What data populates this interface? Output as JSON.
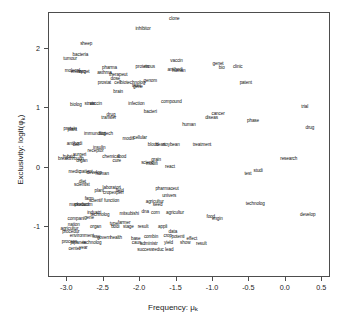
{
  "chart_data": {
    "type": "scatter",
    "title": "",
    "xlabel": "Frequency: μₖ",
    "ylabel": "Exclusivity: logit(φₖ)",
    "xlim": [
      -3.25,
      0.62
    ],
    "ylim": [
      -1.85,
      2.6
    ],
    "xticks": [
      -3.0,
      -2.5,
      -2.0,
      -1.5,
      -1.0,
      -0.5,
      0.0,
      0.5
    ],
    "xticklabels": [
      "-3.0",
      "-2.5",
      "-2.0",
      "-1.5",
      "-1.0",
      "-0.5",
      "0.0",
      "0.5"
    ],
    "yticks": [
      2,
      1,
      0,
      -1
    ],
    "yticklabels": [
      "2",
      "1",
      "0",
      "-1"
    ],
    "grid": false,
    "legend": null,
    "marker": "text-label",
    "point_color": "#111111",
    "frame_color": "#4d4d4d",
    "background": "#ffffff",
    "note": "Each data point is rendered as its word label (R textplot / STM FREX style).",
    "points": [
      {
        "label": "clone",
        "x": -1.53,
        "y": 2.5
      },
      {
        "label": "inhibitor",
        "x": -1.96,
        "y": 2.33
      },
      {
        "label": "sheep",
        "x": -2.74,
        "y": 2.08
      },
      {
        "label": "bacteria",
        "x": -2.82,
        "y": 1.9
      },
      {
        "label": "tumour",
        "x": -2.96,
        "y": 1.83
      },
      {
        "label": "vaccin",
        "x": -1.5,
        "y": 1.8
      },
      {
        "label": "genet",
        "x": -0.93,
        "y": 1.75
      },
      {
        "label": "bio",
        "x": -0.88,
        "y": 1.68
      },
      {
        "label": "clinic",
        "x": -0.66,
        "y": 1.7
      },
      {
        "label": "protein",
        "x": -1.97,
        "y": 1.69
      },
      {
        "label": "mous",
        "x": -1.87,
        "y": 1.69
      },
      {
        "label": "pharma",
        "x": -2.42,
        "y": 1.67
      },
      {
        "label": "molecul",
        "x": -2.93,
        "y": 1.62
      },
      {
        "label": "embryo",
        "x": -2.85,
        "y": 1.61
      },
      {
        "label": "target",
        "x": -2.77,
        "y": 1.61
      },
      {
        "label": "antibodi",
        "x": -1.52,
        "y": 1.64
      },
      {
        "label": "human",
        "x": -1.47,
        "y": 1.62
      },
      {
        "label": "asthma",
        "x": -2.49,
        "y": 1.6
      },
      {
        "label": "therapeut",
        "x": -2.3,
        "y": 1.56
      },
      {
        "label": "dose",
        "x": -2.34,
        "y": 1.5
      },
      {
        "label": "patent",
        "x": -0.55,
        "y": 1.43
      },
      {
        "label": "genom",
        "x": -1.86,
        "y": 1.46
      },
      {
        "label": "biotechnolog",
        "x": -2.1,
        "y": 1.43
      },
      {
        "label": "prostat",
        "x": -2.49,
        "y": 1.42
      },
      {
        "label": "cell",
        "x": -2.31,
        "y": 1.42
      },
      {
        "label": "tissu",
        "x": -2.05,
        "y": 1.38
      },
      {
        "label": "gene",
        "x": -2.03,
        "y": 1.36
      },
      {
        "label": "brain",
        "x": -2.3,
        "y": 1.27
      },
      {
        "label": "compound",
        "x": -1.57,
        "y": 1.1
      },
      {
        "label": "infection",
        "x": -2.05,
        "y": 1.08
      },
      {
        "label": "biolog",
        "x": -2.88,
        "y": 1.06
      },
      {
        "label": "strain",
        "x": -2.69,
        "y": 1.07
      },
      {
        "label": "vaccin2",
        "x": -2.61,
        "y": 1.07
      },
      {
        "label": "trial",
        "x": 0.26,
        "y": 1.02
      },
      {
        "label": "cancer",
        "x": -0.93,
        "y": 0.9
      },
      {
        "label": "bacteri",
        "x": -1.86,
        "y": 0.93
      },
      {
        "label": "diseas",
        "x": -1.02,
        "y": 0.83
      },
      {
        "label": "drug",
        "x": -2.4,
        "y": 0.88
      },
      {
        "label": "transfer",
        "x": -2.43,
        "y": 0.83
      },
      {
        "label": "phase",
        "x": -0.45,
        "y": 0.78
      },
      {
        "label": "human2",
        "x": -1.33,
        "y": 0.72
      },
      {
        "label": "protein2",
        "x": -2.96,
        "y": 0.66
      },
      {
        "label": "plant",
        "x": -2.93,
        "y": 0.64
      },
      {
        "label": "drug2",
        "x": 0.33,
        "y": 0.67
      },
      {
        "label": "immunolog",
        "x": -2.62,
        "y": 0.57
      },
      {
        "label": "biotech",
        "x": -2.47,
        "y": 0.57
      },
      {
        "label": "modifi",
        "x": -2.16,
        "y": 0.48
      },
      {
        "label": "cellular",
        "x": -2.0,
        "y": 0.5
      },
      {
        "label": "antibodi2",
        "x": -2.9,
        "y": 0.4
      },
      {
        "label": "cell2",
        "x": -2.88,
        "y": 0.38
      },
      {
        "label": "blood",
        "x": -1.82,
        "y": 0.39
      },
      {
        "label": "heart",
        "x": -1.72,
        "y": 0.39
      },
      {
        "label": "soybean",
        "x": -1.57,
        "y": 0.39
      },
      {
        "label": "treatment",
        "x": -1.15,
        "y": 0.39
      },
      {
        "label": "insulin",
        "x": -2.56,
        "y": 0.33
      },
      {
        "label": "receptor",
        "x": -2.61,
        "y": 0.28
      },
      {
        "label": "hybrid",
        "x": -2.98,
        "y": 0.18
      },
      {
        "label": "surgeri",
        "x": -2.83,
        "y": 0.22
      },
      {
        "label": "chemical",
        "x": -2.4,
        "y": 0.19
      },
      {
        "label": "food",
        "x": -2.25,
        "y": 0.19
      },
      {
        "label": "breakthrough",
        "x": -2.95,
        "y": 0.14
      },
      {
        "label": "organ",
        "x": -2.8,
        "y": 0.12
      },
      {
        "label": "cure",
        "x": -2.32,
        "y": 0.11
      },
      {
        "label": "research",
        "x": 0.04,
        "y": 0.15
      },
      {
        "label": "grain",
        "x": -1.78,
        "y": 0.13
      },
      {
        "label": "scienc",
        "x": -1.9,
        "y": 0.08
      },
      {
        "label": "modifi2",
        "x": -1.84,
        "y": 0.06
      },
      {
        "label": "react",
        "x": -1.59,
        "y": 0.02
      },
      {
        "label": "medic",
        "x": -2.9,
        "y": -0.07
      },
      {
        "label": "patient",
        "x": -2.74,
        "y": -0.07
      },
      {
        "label": "develop",
        "x": -2.63,
        "y": -0.09
      },
      {
        "label": "human3",
        "x": -2.52,
        "y": -0.1
      },
      {
        "label": "test",
        "x": -0.52,
        "y": -0.1
      },
      {
        "label": "studi",
        "x": -0.38,
        "y": -0.05
      },
      {
        "label": "diet",
        "x": -2.79,
        "y": -0.24
      },
      {
        "label": "scientist",
        "x": -2.8,
        "y": -0.29
      },
      {
        "label": "laboratori",
        "x": -2.39,
        "y": -0.34
      },
      {
        "label": "pharmaceut",
        "x": -1.63,
        "y": -0.35
      },
      {
        "label": "plant2",
        "x": -2.56,
        "y": -0.39
      },
      {
        "label": "field",
        "x": -2.28,
        "y": -0.39
      },
      {
        "label": "crop",
        "x": -2.45,
        "y": -0.42
      },
      {
        "label": "experi",
        "x": -2.31,
        "y": -0.42
      },
      {
        "label": "univers",
        "x": -1.6,
        "y": -0.47
      },
      {
        "label": "farm",
        "x": -2.7,
        "y": -0.52
      },
      {
        "label": "technolog",
        "x": -0.42,
        "y": -0.61
      },
      {
        "label": "scientif",
        "x": -2.61,
        "y": -0.55
      },
      {
        "label": "function",
        "x": -2.39,
        "y": -0.55
      },
      {
        "label": "agricultur",
        "x": -1.8,
        "y": -0.57
      },
      {
        "label": "market",
        "x": -2.88,
        "y": -0.62
      },
      {
        "label": "product",
        "x": -2.8,
        "y": -0.63
      },
      {
        "label": "anim",
        "x": -2.72,
        "y": -0.63
      },
      {
        "label": "seed",
        "x": -1.76,
        "y": -0.62
      },
      {
        "label": "develop2",
        "x": 0.3,
        "y": -0.79
      },
      {
        "label": "industri",
        "x": -2.63,
        "y": -0.76
      },
      {
        "label": "mitsubishi",
        "x": -2.15,
        "y": -0.77
      },
      {
        "label": "dna",
        "x": -1.93,
        "y": -0.75
      },
      {
        "label": "corn",
        "x": -1.79,
        "y": -0.76
      },
      {
        "label": "agricultur2",
        "x": -1.52,
        "y": -0.76
      },
      {
        "label": "food2",
        "x": -1.03,
        "y": -0.82
      },
      {
        "label": "engin",
        "x": -0.94,
        "y": -0.86
      },
      {
        "label": "technolog2",
        "x": -2.55,
        "y": -0.8
      },
      {
        "label": "gene2",
        "x": -2.7,
        "y": -0.84
      },
      {
        "label": "compani",
        "x": -2.88,
        "y": -0.86
      },
      {
        "label": "type",
        "x": -2.36,
        "y": -0.94
      },
      {
        "label": "farmer",
        "x": -2.22,
        "y": -0.92
      },
      {
        "label": "nation",
        "x": -2.91,
        "y": -0.96
      },
      {
        "label": "organ2",
        "x": -2.61,
        "y": -1.0
      },
      {
        "label": "bodi",
        "x": -2.34,
        "y": -1.0
      },
      {
        "label": "stage",
        "x": -2.16,
        "y": -1.0
      },
      {
        "label": "result",
        "x": -1.96,
        "y": -0.99
      },
      {
        "label": "appli",
        "x": -1.69,
        "y": -0.99
      },
      {
        "label": "agricultur3",
        "x": -2.97,
        "y": -1.02
      },
      {
        "label": "procedur",
        "x": -2.95,
        "y": -1.08
      },
      {
        "label": "data",
        "x": -1.55,
        "y": -1.08
      },
      {
        "label": "environment",
        "x": -2.8,
        "y": -1.14
      },
      {
        "label": "crop2",
        "x": -1.62,
        "y": -1.15
      },
      {
        "label": "potenti",
        "x": -1.48,
        "y": -1.16
      },
      {
        "label": "combin",
        "x": -1.85,
        "y": -1.16
      },
      {
        "label": "issu",
        "x": -2.6,
        "y": -1.16
      },
      {
        "label": "govern",
        "x": -2.5,
        "y": -1.17
      },
      {
        "label": "health",
        "x": -2.33,
        "y": -1.17
      },
      {
        "label": "effect",
        "x": -1.29,
        "y": -1.19
      },
      {
        "label": "base",
        "x": -2.06,
        "y": -1.19
      },
      {
        "label": "process",
        "x": -2.97,
        "y": -1.25
      },
      {
        "label": "japanes",
        "x": -2.85,
        "y": -1.26
      },
      {
        "label": "show",
        "x": -1.38,
        "y": -1.27
      },
      {
        "label": "result2",
        "x": -1.16,
        "y": -1.28
      },
      {
        "label": "technolog3",
        "x": -2.66,
        "y": -1.26
      },
      {
        "label": "administr",
        "x": -1.88,
        "y": -1.28
      },
      {
        "label": "caus",
        "x": -2.05,
        "y": -1.26
      },
      {
        "label": "yield",
        "x": -1.61,
        "y": -1.27
      },
      {
        "label": "center",
        "x": -2.9,
        "y": -1.36
      },
      {
        "label": "year",
        "x": -2.78,
        "y": -1.35
      },
      {
        "label": "success",
        "x": -1.93,
        "y": -1.38
      },
      {
        "label": "reduc",
        "x": -1.75,
        "y": -1.38
      },
      {
        "label": "lead",
        "x": -1.6,
        "y": -1.38
      }
    ]
  },
  "axis": {
    "x_title": "Frequency: μ",
    "x_title_sub": "k",
    "y_title": "Exclusivity: logit(φ",
    "y_title_sub": "k",
    "y_title_tail": ")"
  }
}
